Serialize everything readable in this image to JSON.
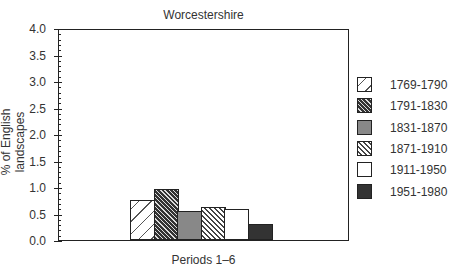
{
  "chart_data": {
    "type": "bar",
    "title": "Worcestershire",
    "xlabel": "Periods 1–6",
    "ylabel": "% of English landscapes",
    "ylim": [
      0,
      4.0
    ],
    "yticks": [
      "0.0",
      "0.5",
      "1.0",
      "1.5",
      "2.0",
      "2.5",
      "3.0",
      "3.5",
      "4.0"
    ],
    "grid": false,
    "legend_position": "right",
    "categories": [
      "1769-1790",
      "1791-1830",
      "1831-1870",
      "1871-1910",
      "1911-1950",
      "1951-1980"
    ],
    "values": [
      0.75,
      0.96,
      0.55,
      0.62,
      0.58,
      0.3
    ],
    "series": [
      {
        "name": "1769-1790",
        "value": 0.75,
        "pattern": "dashed-diagonal"
      },
      {
        "name": "1791-1830",
        "value": 0.96,
        "pattern": "dark-hatch"
      },
      {
        "name": "1831-1870",
        "value": 0.55,
        "pattern": "grey-stipple"
      },
      {
        "name": "1871-1910",
        "value": 0.62,
        "pattern": "light-hatch"
      },
      {
        "name": "1911-1950",
        "value": 0.58,
        "pattern": "white"
      },
      {
        "name": "1951-1980",
        "value": 0.3,
        "pattern": "dark-stipple"
      }
    ]
  }
}
